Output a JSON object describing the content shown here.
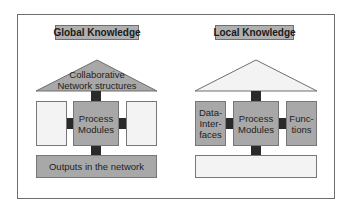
{
  "global": {
    "title": "Global Knowledge",
    "roof": {
      "line1": "Collaborative",
      "line2": "Network structures",
      "fill": "#a8a8a8"
    },
    "left_box": "",
    "center_box": {
      "line1": "Process",
      "line2": "Modules"
    },
    "right_box": "",
    "bottom_box": "Outputs in the network"
  },
  "local": {
    "title": "Local Knowledge",
    "roof": {
      "line1": "",
      "line2": "",
      "fill": "#f3f3f3"
    },
    "left_box": {
      "line1": "Data-",
      "line2": "Inter-",
      "line3": "faces"
    },
    "center_box": {
      "line1": "Process",
      "line2": "Modules"
    },
    "right_box": {
      "line1": "Func-",
      "line2": "tions"
    },
    "bottom_box": ""
  },
  "colors": {
    "gray_box": "#a8a8a8",
    "white_box": "#f3f3f3",
    "connector": "#2a2a2a",
    "title_bg": "#b0b0b0"
  }
}
